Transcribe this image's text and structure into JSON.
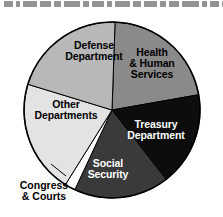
{
  "figure": {
    "top_strip_note": "cropped headline text (illegible)",
    "background_color": "#ffffff",
    "outline_color": "#000000"
  },
  "chart_data": {
    "type": "pie",
    "title": "",
    "subtitle": "",
    "xlabel": "",
    "ylabel": "",
    "legend_position": "none",
    "grid": false,
    "labels_inside_slices": true,
    "categories": [
      "Health & Human Services",
      "Treasury Department",
      "Social Security",
      "Congress & Courts",
      "Other Departments",
      "Defense Department"
    ],
    "values": [
      21.7,
      17.2,
      17.5,
      2.0,
      20.8,
      20.8
    ],
    "units": "percent of total",
    "slices": [
      {
        "label": "Health & Human Services",
        "label_lines": [
          "Health",
          "& Human",
          "Services"
        ],
        "value": 21.7,
        "color": "#8a8a8a",
        "text_color": "#000000",
        "start_angle_deg": 2,
        "end_angle_deg": 80,
        "label_placement": "inside",
        "label_x": 152,
        "label_y": 56
      },
      {
        "label": "Treasury Department",
        "label_lines": [
          "Treasury",
          "Department"
        ],
        "value": 17.2,
        "color": "#0d0d0d",
        "text_color": "#ffffff",
        "start_angle_deg": 80,
        "end_angle_deg": 142,
        "label_placement": "inside",
        "label_x": 156,
        "label_y": 128
      },
      {
        "label": "Social Security",
        "label_lines": [
          "Social",
          "Security"
        ],
        "value": 17.5,
        "color": "#3a3a3a",
        "text_color": "#ffffff",
        "start_angle_deg": 142,
        "end_angle_deg": 205,
        "label_placement": "inside",
        "label_x": 108,
        "label_y": 167
      },
      {
        "label": "Congress & Courts",
        "label_lines": [
          "Congress",
          "& Courts"
        ],
        "value": 2.0,
        "color": "#ffffff",
        "text_color": "#000000",
        "start_angle_deg": 205,
        "end_angle_deg": 212,
        "label_placement": "outside-callout",
        "label_x": 44,
        "label_y": 189,
        "leader_from_x": 66,
        "leader_from_y": 176,
        "leader_to_x": 51,
        "leader_to_y": 164
      },
      {
        "label": "Other Departments",
        "label_lines": [
          "Other",
          "Departments"
        ],
        "value": 20.8,
        "color": "#e3e3e3",
        "text_color": "#000000",
        "start_angle_deg": 212,
        "end_angle_deg": 287,
        "label_placement": "inside",
        "label_x": 66,
        "label_y": 108
      },
      {
        "label": "Defense Department",
        "label_lines": [
          "Defense",
          "Department"
        ],
        "value": 20.8,
        "color": "#b8b8b8",
        "text_color": "#000000",
        "start_angle_deg": 287,
        "end_angle_deg": 362,
        "label_placement": "inside",
        "label_x": 94,
        "label_y": 49
      }
    ],
    "geometry": {
      "center_x": 112,
      "center_y": 110,
      "radius": 88
    }
  }
}
